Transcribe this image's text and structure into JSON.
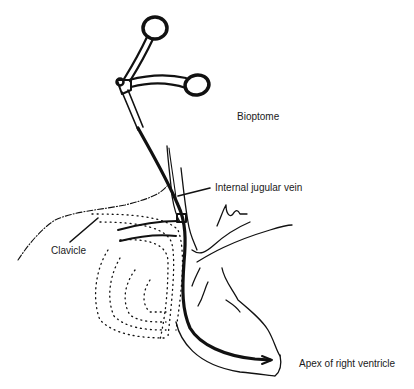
{
  "diagram": {
    "type": "anatomical line illustration",
    "labels": {
      "bioptome": "Bioptome",
      "internal_jugular_vein": "Internal jugular vein",
      "clavicle": "Clavicle",
      "apex_right_ventricle": "Apex of right ventricle"
    },
    "structures": [
      "bioptome-forceps-handle",
      "bioptome-catheter",
      "internal-jugular-vein",
      "clavicle-outline",
      "lung-dotted-outline",
      "heart-outline"
    ],
    "colors": {
      "ink": "#111111",
      "background": "#ffffff"
    }
  }
}
